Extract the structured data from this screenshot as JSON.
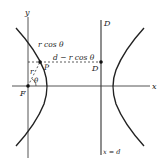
{
  "diagram": {
    "colors": {
      "line": "#333333",
      "axis": "#555555",
      "text": "#222222",
      "background": "#ffffff"
    },
    "axes": {
      "x_label": "x",
      "y_label": "y"
    },
    "directrix": {
      "label": "D",
      "equation": "x = d"
    },
    "points": {
      "focus": "F",
      "point": "P",
      "foot": "D"
    },
    "segments": {
      "radius": "r",
      "angle": "θ",
      "horizontal_top": "r cos θ",
      "horizontal_rest": "d − r cos θ"
    }
  }
}
